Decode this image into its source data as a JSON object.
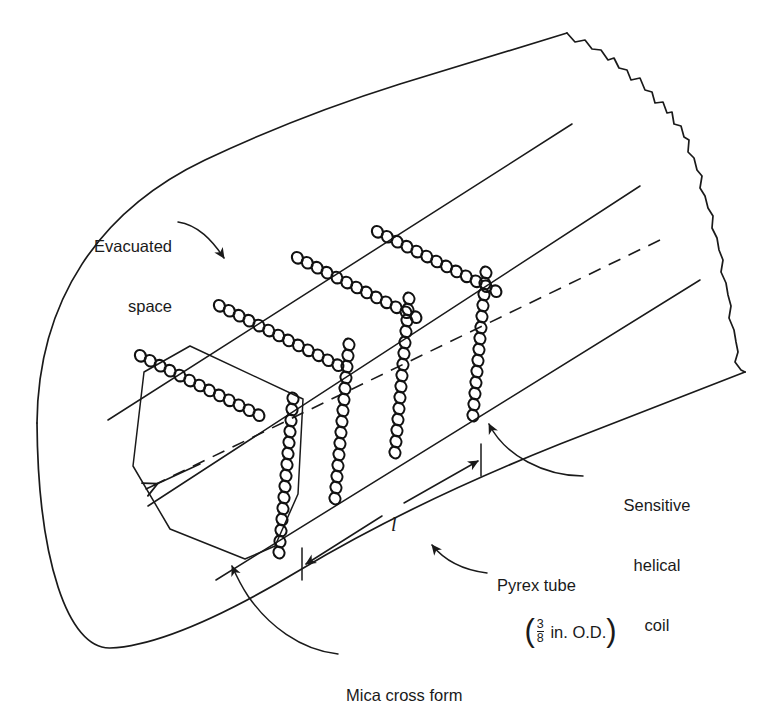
{
  "figure": {
    "name": "sensitive-helical-coil-in-pyrex-tube",
    "background": "#ffffff",
    "ink_color": "#1a1a1a",
    "width": 780,
    "height": 693
  },
  "labels": {
    "evacuated_space": {
      "line1": "Evacuated",
      "line2": "space"
    },
    "sensitive_helical_coil": {
      "line1": "Sensitive",
      "line2": "helical",
      "line3": "coil"
    },
    "pyrex_tube": {
      "line1": "Pyrex tube",
      "paren_open": "(",
      "numerator": "3",
      "denominator": "8",
      "unit": " in. O.D.",
      "paren_close": ")"
    },
    "mica_cross_form": {
      "text": "Mica cross form"
    },
    "length_dimension": {
      "symbol": "l"
    }
  },
  "components": {
    "tube": "Pyrex tube shown in isometric view with rounded left end and jagged torn break at right",
    "coil": "Continuous sensitive helical coil wound in zig-zag around four mica cross forms",
    "axis": "Dashed centerline axis of tube",
    "dimension": "Double-headed dimension line marking coil length l"
  }
}
